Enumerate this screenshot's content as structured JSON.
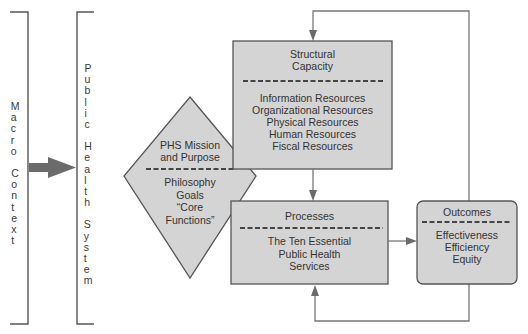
{
  "diagram": {
    "macro_context": {
      "label_words": [
        "Macro",
        "Context"
      ]
    },
    "public_health_system": {
      "label_words": [
        "Public",
        "Health",
        "System"
      ]
    },
    "mission": {
      "title_lines": [
        "PHS Mission",
        "and Purpose"
      ],
      "body_lines": [
        "Philosophy",
        "Goals",
        "“Core",
        "Functions”"
      ]
    },
    "structural_capacity": {
      "title_lines": [
        "Structural",
        "Capacity"
      ],
      "body_lines": [
        "Information Resources",
        "Organizational Resources",
        "Physical Resources",
        "Human Resources",
        "Fiscal Resources"
      ]
    },
    "processes": {
      "title_lines": [
        "Processes"
      ],
      "body_lines": [
        "The Ten Essential",
        "Public Health",
        "Services"
      ]
    },
    "outcomes": {
      "title_lines": [
        "Outcomes"
      ],
      "body_lines": [
        "Effectiveness",
        "Efficiency",
        "Equity"
      ]
    },
    "colors": {
      "box_fill": "#d4d4d4",
      "box_stroke": "#555555",
      "arrow": "#6b6b6b",
      "line": "#777777",
      "dash": "#444444"
    }
  }
}
